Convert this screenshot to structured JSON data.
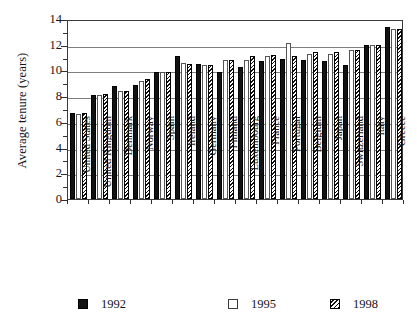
{
  "chart_data": {
    "type": "bar",
    "title": "",
    "xlabel": "",
    "ylabel": "Average tenure (years)",
    "ylim": [
      0,
      14
    ],
    "ytick_labels": [
      "0",
      "2",
      "4",
      "6",
      "8",
      "10",
      "12",
      "14"
    ],
    "ytick_values": [
      0,
      2,
      4,
      6,
      8,
      10,
      12,
      14
    ],
    "yminor_values": [
      1,
      3,
      5,
      7,
      9,
      11,
      13
    ],
    "grid": "horizontal",
    "legend_position": "bottom",
    "categories": [
      "United States",
      "United Kingdom",
      "Denmark",
      "Norway",
      "Spain",
      "Ireland",
      "Germany",
      "Finland",
      "Luxembourg",
      "France",
      "Portugal",
      "Belgium",
      "Japan",
      "Switzerland",
      "Italy",
      "Greece"
    ],
    "series": [
      {
        "name": "1992",
        "values": [
          6.7,
          8.1,
          8.8,
          8.9,
          9.9,
          11.1,
          10.5,
          9.9,
          10.3,
          10.7,
          10.9,
          10.8,
          10.7,
          10.4,
          12.0,
          13.4
        ]
      },
      {
        "name": "1995",
        "values": [
          6.6,
          8.1,
          8.4,
          9.2,
          9.9,
          10.6,
          10.4,
          10.8,
          10.8,
          11.1,
          12.1,
          11.3,
          11.3,
          11.6,
          12.0,
          13.2
        ]
      },
      {
        "name": "1998",
        "values": [
          6.7,
          8.2,
          8.4,
          9.3,
          9.9,
          10.5,
          10.4,
          10.8,
          11.1,
          11.2,
          11.1,
          11.4,
          11.4,
          11.6,
          12.0,
          13.2
        ]
      }
    ]
  },
  "legend": {
    "items": [
      {
        "label": "1992",
        "style": "solid-black"
      },
      {
        "label": "1995",
        "style": "white-open"
      },
      {
        "label": "1998",
        "style": "diagonal-hatch"
      }
    ]
  },
  "colors": {
    "series_1992": "#121212",
    "series_1995": "#ffffff",
    "series_1998_hatch": "#111111",
    "axis": "#2e2e2e",
    "gridline": "#7f7f7f",
    "background": "#ffffff"
  }
}
